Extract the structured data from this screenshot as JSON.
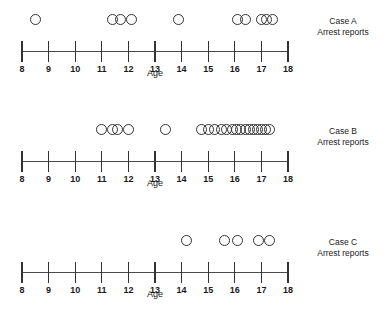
{
  "figure": {
    "axis_title": "Age",
    "axis_min": 8,
    "axis_max": 18,
    "tick_labels": [
      "8",
      "9",
      "10",
      "11",
      "12",
      "13",
      "14",
      "15",
      "16",
      "17",
      "18"
    ],
    "ink_color": "#333333",
    "background_color": "#ffffff"
  },
  "panels": [
    {
      "case_name": "Case A",
      "measure": "Arrest reports",
      "count": 10
    },
    {
      "case_name": "Case B",
      "measure": "Arrest reports",
      "count": 20
    },
    {
      "case_name": "Case C",
      "measure": "Arrest reports",
      "count": 5
    }
  ],
  "chart_data": [
    {
      "type": "scatter",
      "title": "Case A",
      "subtitle": "Arrest reports",
      "xlabel": "Age",
      "ylabel": "",
      "xlim": [
        8,
        18
      ],
      "xticks": [
        8,
        9,
        10,
        11,
        12,
        13,
        14,
        15,
        16,
        17,
        18
      ],
      "grid": false,
      "legend": "none",
      "marker": "open-circle",
      "values": [
        8.5,
        11.4,
        11.7,
        12.1,
        13.9,
        16.1,
        16.4,
        17.0,
        17.2,
        17.4
      ]
    },
    {
      "type": "scatter",
      "title": "Case B",
      "subtitle": "Arrest reports",
      "xlabel": "Age",
      "ylabel": "",
      "xlim": [
        8,
        18
      ],
      "xticks": [
        8,
        9,
        10,
        11,
        12,
        13,
        14,
        15,
        16,
        17,
        18
      ],
      "grid": false,
      "legend": "none",
      "marker": "open-circle",
      "values": [
        11.0,
        11.4,
        11.6,
        12.0,
        13.4,
        14.75,
        15.0,
        15.25,
        15.5,
        15.7,
        15.9,
        16.05,
        16.2,
        16.4,
        16.55,
        16.7,
        16.85,
        17.0,
        17.15,
        17.3
      ]
    },
    {
      "type": "scatter",
      "title": "Case C",
      "subtitle": "Arrest reports",
      "xlabel": "Age",
      "ylabel": "",
      "xlim": [
        8,
        18
      ],
      "xticks": [
        8,
        9,
        10,
        11,
        12,
        13,
        14,
        15,
        16,
        17,
        18
      ],
      "grid": false,
      "legend": "none",
      "marker": "open-circle",
      "values": [
        14.2,
        15.6,
        16.1,
        16.9,
        17.3
      ]
    }
  ]
}
